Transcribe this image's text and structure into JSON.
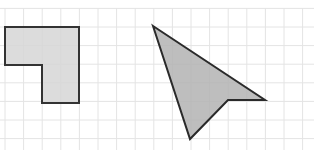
{
  "diagram": {
    "grid": {
      "cell_px": 18.6,
      "origin_x": 5,
      "origin_y": 27,
      "cols": 17,
      "rows": 7,
      "line_color": "#e4e4e4"
    },
    "shapes": [
      {
        "name": "L-shape",
        "fill": "#d6d6d6",
        "stroke": "#333333",
        "points": [
          [
            5,
            27
          ],
          [
            79,
            27
          ],
          [
            79,
            103
          ],
          [
            42,
            103
          ],
          [
            42,
            65
          ],
          [
            5,
            65
          ]
        ]
      },
      {
        "name": "arrowhead-quadrilateral",
        "fill": "#b3b3b3",
        "stroke": "#2a2a2a",
        "points": [
          [
            153,
            26
          ],
          [
            265,
            100
          ],
          [
            228,
            100
          ],
          [
            190,
            139
          ]
        ]
      }
    ]
  }
}
